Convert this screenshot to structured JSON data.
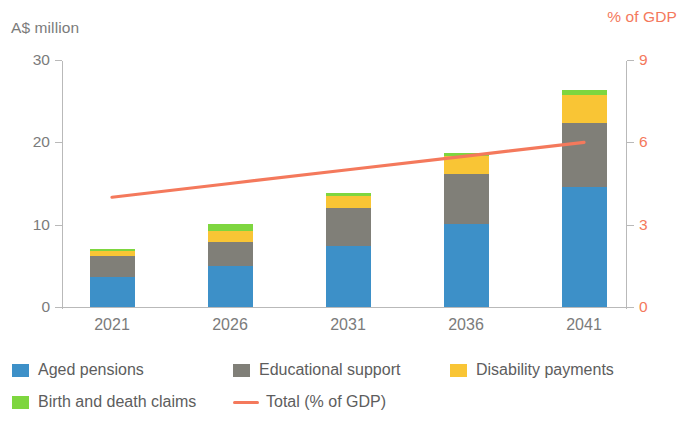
{
  "left_axis": {
    "title": "A$ million",
    "ticks": [
      0,
      10,
      20,
      30
    ],
    "color": "#7b7b7b"
  },
  "right_axis": {
    "title": "% of GDP",
    "ticks": [
      0,
      3,
      6,
      9
    ],
    "color": "#f4795c"
  },
  "legend": {
    "aged_pensions": "Aged pensions",
    "educational_support": "Educational support",
    "disability_payments": "Disability payments",
    "birth_and_death_claims": "Birth and death claims",
    "total_gdp": "Total (% of GDP)"
  },
  "colors": {
    "aged_pensions": "#3d90c8",
    "educational_support": "#807f78",
    "disability_payments": "#f9c535",
    "birth_and_death_claims": "#7ed63f",
    "total_line": "#f4795c",
    "axis_grey": "#b9b9b9",
    "text_grey": "#7b7b7b"
  },
  "chart_data": {
    "type": "bar",
    "title": "",
    "subtitle": "",
    "xlabel": "",
    "ylabel": "A$ million",
    "y2label": "% of GDP",
    "ylim": [
      0,
      30
    ],
    "y2lim": [
      0,
      9
    ],
    "yticks": [
      0,
      10,
      20,
      30
    ],
    "y2ticks": [
      0,
      3,
      6,
      9
    ],
    "grid": false,
    "stacked": true,
    "legend_position": "bottom",
    "categories": [
      "2021",
      "2026",
      "2031",
      "2036",
      "2041"
    ],
    "series": [
      {
        "name": "Aged pensions",
        "axis": "left",
        "values": [
          3.6,
          5.0,
          7.4,
          10.1,
          14.6
        ]
      },
      {
        "name": "Educational support",
        "axis": "left",
        "values": [
          2.6,
          2.9,
          4.6,
          6.0,
          7.8
        ]
      },
      {
        "name": "Disability payments",
        "axis": "left",
        "values": [
          0.6,
          1.3,
          1.5,
          2.2,
          3.4
        ]
      },
      {
        "name": "Birth and death claims",
        "axis": "left",
        "values": [
          0.3,
          0.9,
          0.3,
          0.4,
          0.5
        ]
      }
    ],
    "totals": [
      7.1,
      10.1,
      13.8,
      18.7,
      26.3
    ],
    "line_series": {
      "name": "Total (% of GDP)",
      "axis": "right",
      "type": "line",
      "values": [
        4.0,
        4.5,
        5.0,
        5.5,
        6.0
      ]
    }
  }
}
